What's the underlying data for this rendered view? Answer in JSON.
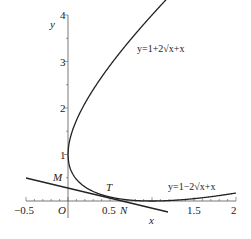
{
  "chart_data": {
    "type": "line",
    "title": "",
    "xlabel": "x",
    "ylabel": "y",
    "xlim": [
      -0.5,
      2
    ],
    "ylim": [
      -0.2,
      4
    ],
    "grid": false,
    "x_ticks": [
      "-0.5",
      "O",
      "0.5",
      "1",
      "1.5",
      "2"
    ],
    "y_ticks": [
      "1",
      "2",
      "3",
      "4"
    ],
    "series": [
      {
        "name": "y=1+2√x+x",
        "formula": "y = 1 + 2*sqrt(x) + x",
        "x": [
          0,
          0.25,
          0.5,
          0.75,
          1.0,
          1.25
        ],
        "y": [
          1,
          2.25,
          2.914,
          3.482,
          4.0,
          4.486
        ]
      },
      {
        "name": "y=1−2√x+x",
        "formula": "y = 1 - 2*sqrt(x) + x",
        "x": [
          0,
          0.25,
          0.5,
          0.75,
          1.0,
          1.5,
          2.0
        ],
        "y": [
          1,
          0.25,
          0.086,
          0.018,
          0,
          0.051,
          0.172
        ]
      },
      {
        "name": "tangent line MTN",
        "x": [
          -0.5,
          1.19
        ],
        "y": [
          0.49,
          -0.24
        ]
      }
    ],
    "annotations": [
      "M",
      "T",
      "N",
      "O",
      "y=1+2√x+x",
      "y=1−2√x+x"
    ]
  },
  "labels": {
    "y_axis": "y",
    "x_axis": "x",
    "origin": "O",
    "M": "M",
    "T": "T",
    "N": "N",
    "upper_curve": "y=1+2√x+x",
    "lower_curve": "y=1−2√x+x",
    "tick_x_neg05": "−0.5",
    "tick_x_05": "0.5",
    "tick_x_1": "1",
    "tick_x_15": "1.5",
    "tick_x_2": "2",
    "tick_y_1": "1",
    "tick_y_2": "2",
    "tick_y_3": "3",
    "tick_y_4": "4"
  }
}
